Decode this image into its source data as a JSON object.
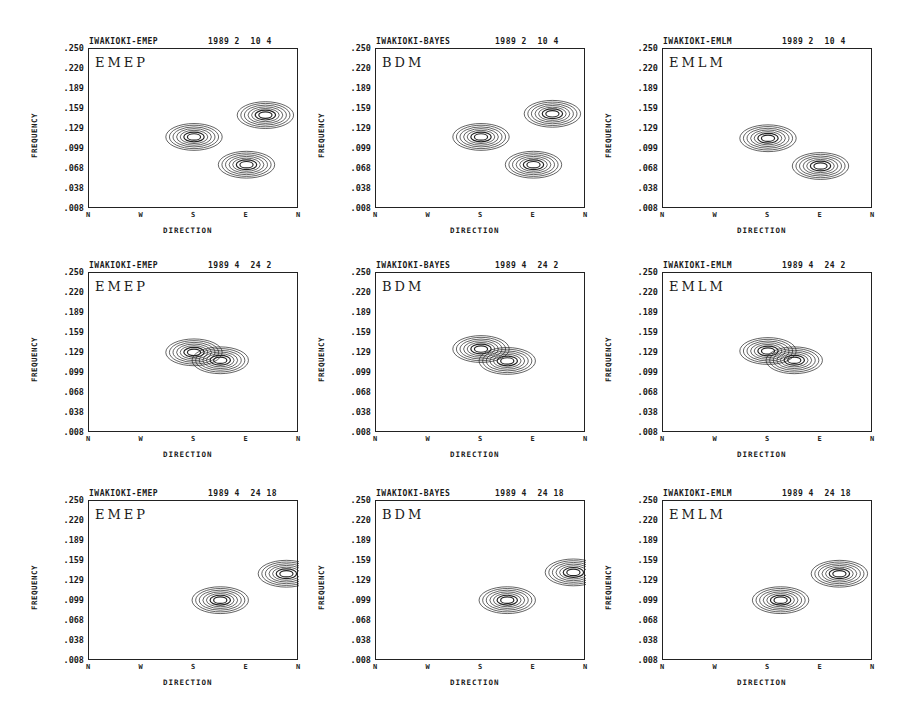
{
  "chart_data": [
    {
      "type": "contour",
      "title": "IWAKIOKI-EMEP",
      "date": "1989 2  10 4",
      "method": "EMEP",
      "xlabel": "DIRECTION",
      "ylabel": "FREQUENCY",
      "xticks": [
        "N",
        "W",
        "S",
        "E",
        "N"
      ],
      "yticks": [
        ".250",
        ".220",
        ".189",
        ".159",
        ".129",
        ".099",
        ".068",
        ".038",
        ".008"
      ],
      "ylim": [
        0.008,
        0.25
      ],
      "peaks": [
        {
          "direction": "S",
          "frequency": 0.117
        },
        {
          "direction": "E",
          "frequency": 0.075
        },
        {
          "direction": "ENE",
          "frequency": 0.15
        }
      ]
    },
    {
      "type": "contour",
      "title": "IWAKIOKI-BAYES",
      "date": "1989 2  10 4",
      "method": "BDM",
      "xlabel": "DIRECTION",
      "ylabel": "FREQUENCY",
      "xticks": [
        "N",
        "W",
        "S",
        "E",
        "N"
      ],
      "yticks": [
        ".250",
        ".220",
        ".189",
        ".159",
        ".129",
        ".099",
        ".068",
        ".038",
        ".008"
      ],
      "ylim": [
        0.008,
        0.25
      ],
      "peaks": [
        {
          "direction": "S",
          "frequency": 0.117
        },
        {
          "direction": "E",
          "frequency": 0.075
        },
        {
          "direction": "ENE",
          "frequency": 0.152
        }
      ]
    },
    {
      "type": "contour",
      "title": "IWAKIOKI-EMLM",
      "date": "1989 2  10 4",
      "method": "EMLM",
      "xlabel": "DIRECTION",
      "ylabel": "FREQUENCY",
      "xticks": [
        "N",
        "W",
        "S",
        "E",
        "N"
      ],
      "yticks": [
        ".250",
        ".220",
        ".189",
        ".159",
        ".129",
        ".099",
        ".068",
        ".038",
        ".008"
      ],
      "ylim": [
        0.008,
        0.25
      ],
      "peaks": [
        {
          "direction": "S",
          "frequency": 0.115
        },
        {
          "direction": "E",
          "frequency": 0.073
        }
      ]
    },
    {
      "type": "contour",
      "title": "IWAKIOKI-EMEP",
      "date": "1989 4  24 2",
      "method": "EMEP",
      "xlabel": "DIRECTION",
      "ylabel": "FREQUENCY",
      "xticks": [
        "N",
        "W",
        "S",
        "E",
        "N"
      ],
      "yticks": [
        ".250",
        ".220",
        ".189",
        ".159",
        ".129",
        ".099",
        ".068",
        ".038",
        ".008"
      ],
      "ylim": [
        0.008,
        0.25
      ],
      "peaks": [
        {
          "direction": "S",
          "frequency": 0.13
        },
        {
          "direction": "SE",
          "frequency": 0.118
        }
      ]
    },
    {
      "type": "contour",
      "title": "IWAKIOKI-BAYES",
      "date": "1989 4  24 2",
      "method": "BDM",
      "xlabel": "DIRECTION",
      "ylabel": "FREQUENCY",
      "xticks": [
        "N",
        "W",
        "S",
        "E",
        "N"
      ],
      "yticks": [
        ".250",
        ".220",
        ".189",
        ".159",
        ".129",
        ".099",
        ".068",
        ".038",
        ".008"
      ],
      "ylim": [
        0.008,
        0.25
      ],
      "peaks": [
        {
          "direction": "S",
          "frequency": 0.135
        },
        {
          "direction": "SE",
          "frequency": 0.117
        }
      ]
    },
    {
      "type": "contour",
      "title": "IWAKIOKI-EMLM",
      "date": "1989 4  24 2",
      "method": "EMLM",
      "xlabel": "DIRECTION",
      "ylabel": "FREQUENCY",
      "xticks": [
        "N",
        "W",
        "S",
        "E",
        "N"
      ],
      "yticks": [
        ".250",
        ".220",
        ".189",
        ".159",
        ".129",
        ".099",
        ".068",
        ".038",
        ".008"
      ],
      "ylim": [
        0.008,
        0.25
      ],
      "peaks": [
        {
          "direction": "S",
          "frequency": 0.132
        },
        {
          "direction": "SE",
          "frequency": 0.118
        }
      ]
    },
    {
      "type": "contour",
      "title": "IWAKIOKI-EMEP",
      "date": "1989 4  24 18",
      "method": "EMEP",
      "xlabel": "DIRECTION",
      "ylabel": "FREQUENCY",
      "xticks": [
        "N",
        "W",
        "S",
        "E",
        "N"
      ],
      "yticks": [
        ".250",
        ".220",
        ".189",
        ".159",
        ".129",
        ".099",
        ".068",
        ".038",
        ".008"
      ],
      "ylim": [
        0.008,
        0.25
      ],
      "peaks": [
        {
          "direction": "SE",
          "frequency": 0.1
        },
        {
          "direction": "NNE",
          "frequency": 0.14
        }
      ]
    },
    {
      "type": "contour",
      "title": "IWAKIOKI-BAYES",
      "date": "1989 4  24 18",
      "method": "BDM",
      "xlabel": "DIRECTION",
      "ylabel": "FREQUENCY",
      "xticks": [
        "N",
        "W",
        "S",
        "E",
        "N"
      ],
      "yticks": [
        ".250",
        ".220",
        ".189",
        ".159",
        ".129",
        ".099",
        ".068",
        ".038",
        ".008"
      ],
      "ylim": [
        0.008,
        0.25
      ],
      "peaks": [
        {
          "direction": "SE",
          "frequency": 0.1
        },
        {
          "direction": "NNE",
          "frequency": 0.142
        }
      ]
    },
    {
      "type": "contour",
      "title": "IWAKIOKI-EMLM",
      "date": "1989 4  24 18",
      "method": "EMLM",
      "xlabel": "DIRECTION",
      "ylabel": "FREQUENCY",
      "xticks": [
        "N",
        "W",
        "S",
        "E",
        "N"
      ],
      "yticks": [
        ".250",
        ".220",
        ".189",
        ".159",
        ".129",
        ".099",
        ".068",
        ".038",
        ".008"
      ],
      "ylim": [
        0.008,
        0.25
      ],
      "peaks": [
        {
          "direction": "S-SE",
          "frequency": 0.1
        },
        {
          "direction": "ENE",
          "frequency": 0.14
        }
      ]
    }
  ]
}
